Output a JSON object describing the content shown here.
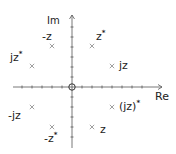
{
  "diagram": {
    "type": "complex-plane-symmetry",
    "axes": {
      "horizontal_label": "Re",
      "vertical_label": "Im",
      "origin_marker": "circle"
    },
    "points": [
      {
        "id": "neg-z",
        "label": "-z",
        "base": "-z",
        "sup": "",
        "x": 52,
        "y": 46,
        "lx": 42,
        "ly": 31
      },
      {
        "id": "z-conj",
        "label": "z*",
        "base": "z",
        "sup": "*",
        "x": 92,
        "y": 46,
        "lx": 96,
        "ly": 31
      },
      {
        "id": "jz-conj",
        "label": "jz*",
        "base": "jz",
        "sup": "*",
        "x": 32,
        "y": 66,
        "lx": 10,
        "ly": 52
      },
      {
        "id": "jz",
        "label": "jz",
        "base": "jz",
        "sup": "",
        "x": 112,
        "y": 66,
        "lx": 119,
        "ly": 60
      },
      {
        "id": "neg-jz",
        "label": "-jz",
        "base": "-jz",
        "sup": "",
        "x": 32,
        "y": 107,
        "lx": 8,
        "ly": 110
      },
      {
        "id": "jz-all-conj",
        "label": "(jz)*",
        "base": "(jz)",
        "sup": "*",
        "x": 112,
        "y": 107,
        "lx": 119,
        "ly": 101
      },
      {
        "id": "neg-z-conj",
        "label": "-z*",
        "base": "-z",
        "sup": "*",
        "x": 52,
        "y": 127,
        "lx": 44,
        "ly": 133
      },
      {
        "id": "z",
        "label": "z",
        "base": "z",
        "sup": "",
        "x": 92,
        "y": 127,
        "lx": 100,
        "ly": 124
      }
    ]
  }
}
